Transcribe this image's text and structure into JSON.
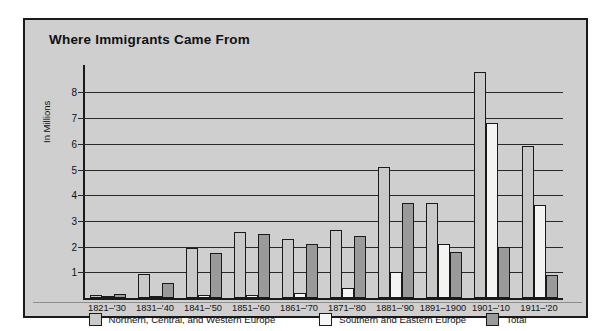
{
  "chart_data": {
    "type": "bar",
    "title": "Where Immigrants Came From",
    "xlabel": "",
    "ylabel": "In Millions",
    "ylim": [
      0,
      8.8
    ],
    "yticks": [
      1,
      2,
      3,
      4,
      5,
      6,
      7,
      8
    ],
    "grid": true,
    "legend_position": "bottom",
    "categories": [
      "1821–'30",
      "1831–'40",
      "1841–'50",
      "1851–'60",
      "1861–'70",
      "1871–'80",
      "1881–'90",
      "1891–1900",
      "1901–'10",
      "1911–'20"
    ],
    "series": [
      {
        "name": "Northern, Central, and Western Europe",
        "color": "#c9c9c9",
        "values": [
          0.1,
          0.95,
          1.95,
          2.55,
          2.3,
          2.65,
          5.1,
          3.7,
          8.8,
          5.9
        ]
      },
      {
        "name": "Southern and Eastern Europe",
        "color": "#f4f4f2",
        "values": [
          0.02,
          0.05,
          0.1,
          0.1,
          0.2,
          0.4,
          1.0,
          2.1,
          6.8,
          3.6
        ]
      },
      {
        "name": "Total",
        "color": "#9a9a9a",
        "values": [
          0.15,
          0.6,
          1.75,
          2.5,
          2.1,
          2.4,
          3.7,
          1.8,
          2.0,
          0.9
        ]
      }
    ]
  },
  "legend": {
    "items": [
      {
        "label": "Northern, Central, and Western Europe",
        "swatch": "ncw"
      },
      {
        "label": "Southern and Eastern Europe",
        "swatch": "se"
      },
      {
        "label": "Total",
        "swatch": "tot"
      }
    ]
  }
}
